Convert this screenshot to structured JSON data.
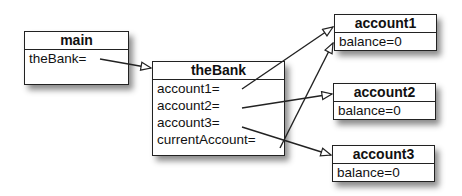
{
  "objects": {
    "main": {
      "title": "main",
      "fields": [
        "theBank="
      ]
    },
    "theBank": {
      "title": "theBank",
      "fields": [
        "account1=",
        "account2=",
        "account3=",
        "currentAccount="
      ]
    },
    "account1": {
      "title": "account1",
      "fields": [
        "balance=0"
      ]
    },
    "account2": {
      "title": "account2",
      "fields": [
        "balance=0"
      ]
    },
    "account3": {
      "title": "account3",
      "fields": [
        "balance=0"
      ]
    }
  },
  "references": [
    {
      "from": "main.theBank",
      "to": "theBank"
    },
    {
      "from": "theBank.account1",
      "to": "account1"
    },
    {
      "from": "theBank.account2",
      "to": "account2"
    },
    {
      "from": "theBank.account3",
      "to": "account3"
    },
    {
      "from": "theBank.currentAccount",
      "to": "account1"
    }
  ]
}
